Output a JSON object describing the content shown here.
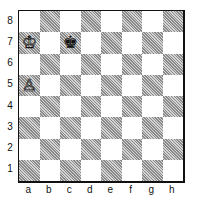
{
  "board": {
    "files": [
      "a",
      "b",
      "c",
      "d",
      "e",
      "f",
      "g",
      "h"
    ],
    "ranks": [
      "8",
      "7",
      "6",
      "5",
      "4",
      "3",
      "2",
      "1"
    ],
    "light_color": "#ffffff",
    "dark_color": "#9a9a9a",
    "pieces": [
      {
        "square": "a7",
        "type": "king",
        "color": "white",
        "glyph": "♔"
      },
      {
        "square": "c7",
        "type": "king",
        "color": "black",
        "glyph": "♚"
      },
      {
        "square": "a5",
        "type": "pawn",
        "color": "white",
        "glyph": "♙"
      }
    ]
  }
}
